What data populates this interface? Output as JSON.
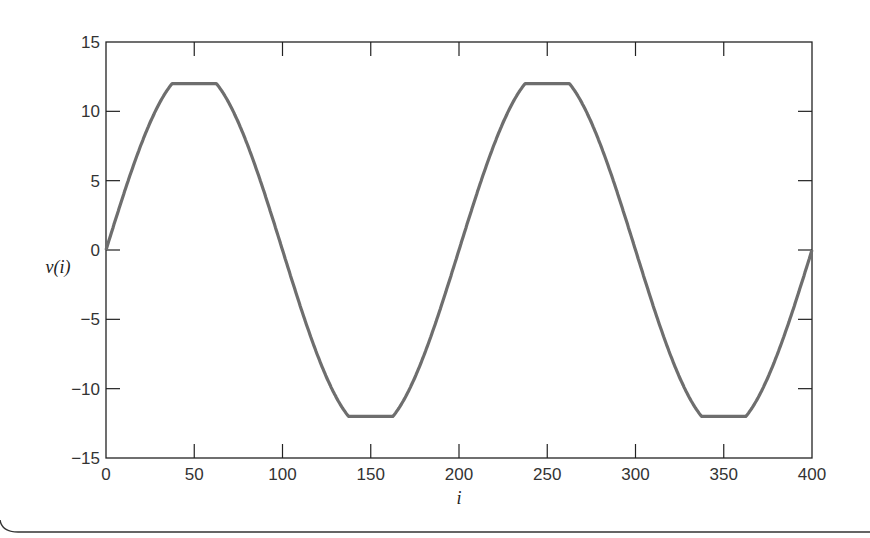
{
  "chart_data": {
    "type": "line",
    "title": "",
    "xlabel": "i",
    "ylabel": "v(i)",
    "xlim": [
      0,
      400
    ],
    "ylim": [
      -15,
      15
    ],
    "xticks": [
      0,
      50,
      100,
      150,
      200,
      250,
      300,
      350,
      400
    ],
    "yticks": [
      15,
      10,
      5,
      0,
      -5,
      -10,
      -15
    ],
    "xtick_labels": [
      "0",
      "50",
      "100",
      "150",
      "200",
      "250",
      "300",
      "350",
      "400"
    ],
    "ytick_labels": [
      "15",
      "10",
      "5",
      "0",
      "−5",
      "−10",
      "−15"
    ],
    "grid": false,
    "legend": null,
    "series": [
      {
        "name": "v(i)",
        "description": "Clipped sinusoid: 13·sin(2πi/200) limited to ±12",
        "color": "#6e6e6e",
        "amplitude": 13,
        "period": 200,
        "clip_level": 12,
        "x": [
          0,
          10,
          20,
          30,
          37,
          50,
          63,
          70,
          80,
          90,
          100,
          110,
          120,
          130,
          137,
          150,
          163,
          170,
          180,
          190,
          200,
          210,
          220,
          230,
          237,
          250,
          263,
          270,
          280,
          290,
          300,
          310,
          320,
          330,
          337,
          350,
          363,
          370,
          380,
          390,
          400
        ],
        "values": [
          0,
          4.02,
          7.64,
          10.52,
          12,
          12,
          12,
          10.52,
          7.64,
          4.02,
          0,
          -4.02,
          -7.64,
          -10.52,
          -12,
          -12,
          -12,
          -10.52,
          -7.64,
          -4.02,
          0,
          4.02,
          7.64,
          10.52,
          12,
          12,
          12,
          10.52,
          7.64,
          4.02,
          0,
          -4.02,
          -7.64,
          -10.52,
          -12,
          -12,
          -12,
          -10.52,
          -7.64,
          -4.02,
          0
        ]
      }
    ]
  },
  "style": {
    "line_color": "#6e6e6e",
    "axis_color": "#222222",
    "frame_color": "#333333"
  }
}
